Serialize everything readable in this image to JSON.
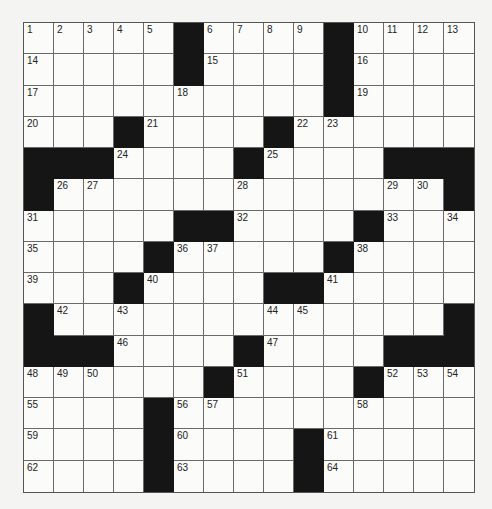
{
  "puzzle": {
    "rows": 15,
    "cols": 15,
    "colors": {
      "background": "#f4f4f2",
      "cell": "#fbfbf9",
      "block": "#151515",
      "line": "#6a6a6a",
      "number": "#222222"
    },
    "grid": [
      [
        "1",
        "2",
        "3",
        "4",
        "5",
        "#",
        "6",
        "7",
        "8",
        "9",
        "#",
        "10",
        "11",
        "12",
        "13"
      ],
      [
        "14",
        ".",
        ".",
        ".",
        ".",
        "#",
        "15",
        ".",
        ".",
        ".",
        "#",
        "16",
        ".",
        ".",
        "."
      ],
      [
        "17",
        ".",
        ".",
        ".",
        ".",
        "18",
        ".",
        ".",
        ".",
        ".",
        "#",
        "19",
        ".",
        ".",
        "."
      ],
      [
        "20",
        ".",
        ".",
        "#",
        "21",
        ".",
        ".",
        ".",
        "#",
        "22",
        "23",
        ".",
        ".",
        ".",
        "."
      ],
      [
        "#",
        "#",
        "#",
        "24",
        ".",
        ".",
        ".",
        "#",
        "25",
        ".",
        ".",
        ".",
        "#",
        "#",
        "#"
      ],
      [
        "#",
        "26",
        "27",
        ".",
        ".",
        ".",
        ".",
        "28",
        ".",
        ".",
        ".",
        ".",
        "29",
        "30",
        "#"
      ],
      [
        "31",
        ".",
        ".",
        ".",
        ".",
        "#",
        "#",
        "32",
        ".",
        ".",
        ".",
        "#",
        "33",
        ".",
        "34"
      ],
      [
        "35",
        ".",
        ".",
        ".",
        "#",
        "36",
        "37",
        ".",
        ".",
        ".",
        "#",
        "38",
        ".",
        ".",
        "."
      ],
      [
        "39",
        ".",
        ".",
        "#",
        "40",
        ".",
        ".",
        ".",
        "#",
        "#",
        "41",
        ".",
        ".",
        ".",
        "."
      ],
      [
        "#",
        "42",
        ".",
        "43",
        ".",
        ".",
        ".",
        ".",
        "44",
        "45",
        ".",
        ".",
        ".",
        ".",
        "#"
      ],
      [
        "#",
        "#",
        "#",
        "46",
        ".",
        ".",
        ".",
        "#",
        "47",
        ".",
        ".",
        ".",
        "#",
        "#",
        "#"
      ],
      [
        "48",
        "49",
        "50",
        ".",
        ".",
        ".",
        "#",
        "51",
        ".",
        ".",
        ".",
        "#",
        "52",
        "53",
        "54"
      ],
      [
        "55",
        ".",
        ".",
        ".",
        "#",
        "56",
        "57",
        ".",
        ".",
        ".",
        ".",
        "58",
        ".",
        ".",
        "."
      ],
      [
        "59",
        ".",
        ".",
        ".",
        "#",
        "60",
        ".",
        ".",
        ".",
        "#",
        "61",
        ".",
        ".",
        ".",
        "."
      ],
      [
        "62",
        ".",
        ".",
        ".",
        "#",
        "63",
        ".",
        ".",
        ".",
        "#",
        "64",
        ".",
        ".",
        ".",
        "."
      ]
    ]
  }
}
